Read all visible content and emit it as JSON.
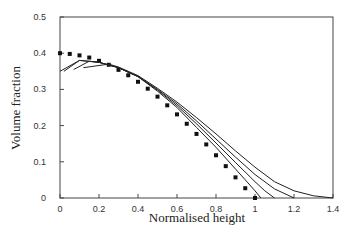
{
  "chart_data": {
    "type": "line",
    "title": "",
    "xlabel": "Normalised height",
    "ylabel": "Volume fraction",
    "xlim": [
      0,
      1.4
    ],
    "ylim": [
      0,
      0.5
    ],
    "xticks": [
      "0",
      "0.2",
      "0.4",
      "0.6",
      "0.8",
      "1",
      "1.2",
      "1.4"
    ],
    "yticks": [
      "0",
      "0.1",
      "0.2",
      "0.3",
      "0.4",
      "0.5"
    ],
    "grid": false,
    "legend": null,
    "series": [
      {
        "name": "dotted (square markers)",
        "style": "markers",
        "x": [
          0,
          0.05,
          0.1,
          0.15,
          0.2,
          0.25,
          0.3,
          0.35,
          0.4,
          0.45,
          0.5,
          0.55,
          0.6,
          0.65,
          0.7,
          0.75,
          0.8,
          0.85,
          0.9,
          0.95,
          1.0
        ],
        "y": [
          0.4,
          0.398,
          0.394,
          0.388,
          0.379,
          0.368,
          0.354,
          0.339,
          0.321,
          0.302,
          0.28,
          0.256,
          0.231,
          0.205,
          0.177,
          0.148,
          0.118,
          0.088,
          0.057,
          0.027,
          0.0
        ]
      },
      {
        "name": "solid curve 1",
        "style": "line",
        "x": [
          0.0,
          0.1,
          0.2,
          0.3,
          0.4,
          0.5,
          0.6,
          0.7,
          0.8,
          0.9,
          0.95,
          1.0,
          1.03
        ],
        "y": [
          0.35,
          0.38,
          0.375,
          0.36,
          0.335,
          0.295,
          0.25,
          0.195,
          0.14,
          0.08,
          0.05,
          0.02,
          0.0
        ]
      },
      {
        "name": "solid curve 2",
        "style": "line",
        "x": [
          0.02,
          0.1,
          0.2,
          0.3,
          0.4,
          0.5,
          0.6,
          0.7,
          0.8,
          0.9,
          1.0,
          1.05,
          1.1
        ],
        "y": [
          0.35,
          0.38,
          0.375,
          0.36,
          0.335,
          0.298,
          0.255,
          0.205,
          0.152,
          0.098,
          0.045,
          0.02,
          0.0
        ]
      },
      {
        "name": "solid curve 3",
        "style": "line",
        "x": [
          0.07,
          0.15,
          0.2,
          0.3,
          0.4,
          0.5,
          0.6,
          0.7,
          0.8,
          0.9,
          1.0,
          1.1,
          1.2
        ],
        "y": [
          0.355,
          0.378,
          0.375,
          0.36,
          0.336,
          0.3,
          0.26,
          0.213,
          0.163,
          0.113,
          0.065,
          0.025,
          0.0
        ]
      },
      {
        "name": "solid curve 4",
        "style": "line",
        "x": [
          0.12,
          0.25,
          0.3,
          0.4,
          0.5,
          0.6,
          0.7,
          0.8,
          0.9,
          1.0,
          1.1,
          1.2,
          1.3,
          1.4
        ],
        "y": [
          0.36,
          0.37,
          0.362,
          0.338,
          0.303,
          0.265,
          0.222,
          0.177,
          0.13,
          0.085,
          0.045,
          0.02,
          0.006,
          0.0
        ]
      }
    ]
  }
}
